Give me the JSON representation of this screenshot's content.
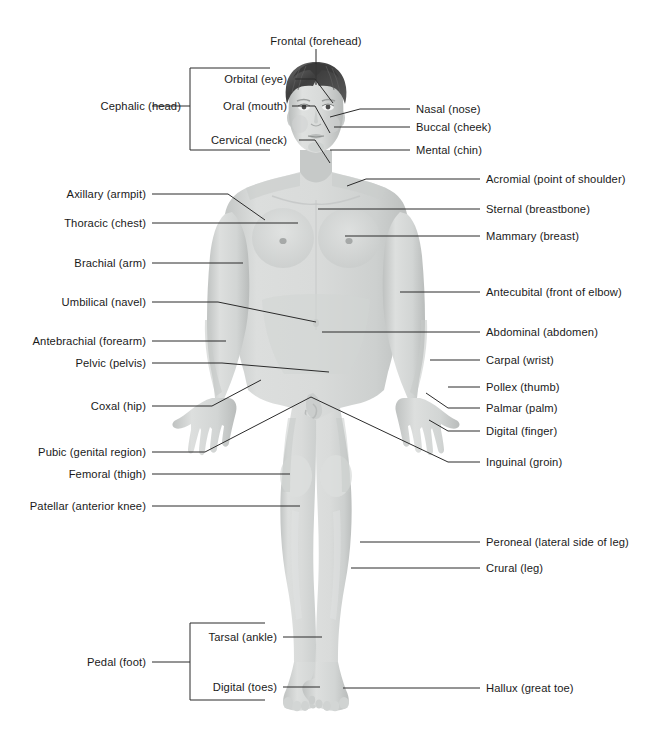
{
  "figure": {
    "view": "anterior",
    "background_color": "#ffffff",
    "body_fill_color": "#d5d7d6",
    "body_shadow_color": "#b4b7b6",
    "hair_color": "#4a4a4a",
    "leader_line_color": "#2b2b2b",
    "text_color": "#1a1a1a"
  },
  "labels": {
    "top": [
      {
        "id": "frontal",
        "text": "Frontal (forehead)",
        "align": "center",
        "x": 316,
        "y": 41
      }
    ],
    "left_column": [
      {
        "id": "cephalic",
        "text": "Cephalic (head)",
        "x": 181,
        "y": 106
      },
      {
        "id": "axillary",
        "text": "Axillary (armpit)",
        "x": 146,
        "y": 194
      },
      {
        "id": "thoracic",
        "text": "Thoracic (chest)",
        "x": 146,
        "y": 223
      },
      {
        "id": "brachial",
        "text": "Brachial (arm)",
        "x": 146,
        "y": 263
      },
      {
        "id": "umbilical",
        "text": "Umbilical (navel)",
        "x": 146,
        "y": 302
      },
      {
        "id": "antebrachial",
        "text": "Antebrachial (forearm)",
        "x": 146,
        "y": 341
      },
      {
        "id": "pelvic",
        "text": "Pelvic (pelvis)",
        "x": 146,
        "y": 363
      },
      {
        "id": "coxal",
        "text": "Coxal (hip)",
        "x": 146,
        "y": 406
      },
      {
        "id": "pubic",
        "text": "Pubic (genital region)",
        "x": 146,
        "y": 452
      },
      {
        "id": "femoral",
        "text": "Femoral (thigh)",
        "x": 146,
        "y": 474
      },
      {
        "id": "patellar",
        "text": "Patellar (anterior knee)",
        "x": 146,
        "y": 506
      },
      {
        "id": "pedal",
        "text": "Pedal (foot)",
        "x": 146,
        "y": 662
      }
    ],
    "head_bracket_items": [
      {
        "id": "orbital",
        "text": "Orbital (eye)",
        "x": 287,
        "y": 79
      },
      {
        "id": "oral",
        "text": "Oral (mouth)",
        "x": 287,
        "y": 106
      },
      {
        "id": "cervical",
        "text": "Cervical (neck)",
        "x": 287,
        "y": 140
      }
    ],
    "pedal_bracket_items": [
      {
        "id": "tarsal",
        "text": "Tarsal (ankle)",
        "x": 277,
        "y": 637
      },
      {
        "id": "digital_toes",
        "text": "Digital (toes)",
        "x": 277,
        "y": 687
      }
    ],
    "right_column": [
      {
        "id": "nasal",
        "text": "Nasal (nose)",
        "x": 416,
        "y": 109
      },
      {
        "id": "buccal",
        "text": "Buccal (cheek)",
        "x": 416,
        "y": 127
      },
      {
        "id": "mental",
        "text": "Mental (chin)",
        "x": 416,
        "y": 150
      },
      {
        "id": "acromial",
        "text": "Acromial (point of shoulder)",
        "x": 486,
        "y": 179
      },
      {
        "id": "sternal",
        "text": "Sternal (breastbone)",
        "x": 486,
        "y": 209
      },
      {
        "id": "mammary",
        "text": "Mammary (breast)",
        "x": 486,
        "y": 236
      },
      {
        "id": "antecubital",
        "text": "Antecubital (front of elbow)",
        "x": 486,
        "y": 292
      },
      {
        "id": "abdominal",
        "text": "Abdominal (abdomen)",
        "x": 486,
        "y": 332
      },
      {
        "id": "carpal",
        "text": "Carpal (wrist)",
        "x": 486,
        "y": 360
      },
      {
        "id": "pollex",
        "text": "Pollex (thumb)",
        "x": 486,
        "y": 387
      },
      {
        "id": "palmar",
        "text": "Palmar (palm)",
        "x": 486,
        "y": 408
      },
      {
        "id": "digital_fing",
        "text": "Digital (finger)",
        "x": 486,
        "y": 431
      },
      {
        "id": "inguinal",
        "text": "Inguinal (groin)",
        "x": 486,
        "y": 462
      },
      {
        "id": "peroneal",
        "text": "Peroneal (lateral side of leg)",
        "x": 486,
        "y": 542
      },
      {
        "id": "crural",
        "text": "Crural (leg)",
        "x": 486,
        "y": 568
      },
      {
        "id": "hallux",
        "text": "Hallux (great toe)",
        "x": 486,
        "y": 688
      }
    ]
  },
  "leader_lines": {
    "frontal": [
      [
        316,
        49
      ],
      [
        316,
        85
      ]
    ],
    "orbital": [
      [
        295,
        79
      ],
      [
        315,
        79
      ],
      [
        333,
        103
      ]
    ],
    "oral": [
      [
        292,
        106
      ],
      [
        315,
        106
      ],
      [
        330,
        133
      ]
    ],
    "cervical": [
      [
        299,
        140
      ],
      [
        315,
        140
      ],
      [
        330,
        163
      ]
    ],
    "nasal": [
      [
        410,
        109
      ],
      [
        360,
        109
      ],
      [
        330,
        117
      ]
    ],
    "buccal": [
      [
        410,
        127
      ],
      [
        334,
        127
      ]
    ],
    "mental": [
      [
        410,
        150
      ],
      [
        330,
        150
      ]
    ],
    "acromial": [
      [
        480,
        179
      ],
      [
        366,
        179
      ],
      [
        347,
        186
      ]
    ],
    "sternal": [
      [
        480,
        209
      ],
      [
        318,
        209
      ]
    ],
    "mammary": [
      [
        480,
        236
      ],
      [
        345,
        236
      ]
    ],
    "antecubital": [
      [
        480,
        292
      ],
      [
        400,
        292
      ]
    ],
    "abdominal": [
      [
        480,
        332
      ],
      [
        322,
        332
      ]
    ],
    "carpal": [
      [
        480,
        360
      ],
      [
        430,
        360
      ]
    ],
    "pollex": [
      [
        480,
        387
      ],
      [
        448,
        387
      ]
    ],
    "palmar": [
      [
        480,
        408
      ],
      [
        448,
        408
      ],
      [
        426,
        393
      ]
    ],
    "digital_fing": [
      [
        480,
        431
      ],
      [
        448,
        431
      ],
      [
        429,
        420
      ]
    ],
    "inguinal": [
      [
        480,
        462
      ],
      [
        448,
        462
      ],
      [
        311,
        397
      ]
    ],
    "peroneal": [
      [
        480,
        542
      ],
      [
        360,
        542
      ]
    ],
    "crural": [
      [
        480,
        568
      ],
      [
        351,
        568
      ]
    ],
    "hallux": [
      [
        480,
        688
      ],
      [
        343,
        688
      ]
    ],
    "axillary": [
      [
        152,
        194
      ],
      [
        228,
        194
      ],
      [
        265,
        220
      ]
    ],
    "thoracic": [
      [
        152,
        223
      ],
      [
        298,
        223
      ]
    ],
    "brachial": [
      [
        152,
        263
      ],
      [
        243,
        263
      ]
    ],
    "umbilical": [
      [
        152,
        302
      ],
      [
        218,
        302
      ],
      [
        316,
        322
      ]
    ],
    "antebrachial": [
      [
        152,
        341
      ],
      [
        226,
        341
      ]
    ],
    "pelvic": [
      [
        152,
        363
      ],
      [
        222,
        363
      ],
      [
        329,
        372
      ]
    ],
    "coxal": [
      [
        152,
        406
      ],
      [
        212,
        406
      ],
      [
        261,
        380
      ]
    ],
    "pubic": [
      [
        152,
        452
      ],
      [
        205,
        452
      ],
      [
        311,
        397
      ]
    ],
    "femoral": [
      [
        152,
        474
      ],
      [
        290,
        474
      ]
    ],
    "patellar": [
      [
        152,
        506
      ],
      [
        300,
        506
      ]
    ],
    "tarsal": [
      [
        283,
        637
      ],
      [
        322,
        637
      ]
    ],
    "digital_toes": [
      [
        283,
        687
      ],
      [
        320,
        687
      ]
    ],
    "cephalic": [
      [
        152,
        106
      ],
      [
        190,
        106
      ]
    ],
    "pedal": [
      [
        152,
        662
      ],
      [
        190,
        662
      ]
    ]
  },
  "brackets": {
    "cephalic": {
      "x": 190,
      "top": 68,
      "bottom": 150,
      "stub_x": 270
    },
    "pedal": {
      "x": 190,
      "top": 623,
      "bottom": 700,
      "stub_x": 265
    }
  }
}
